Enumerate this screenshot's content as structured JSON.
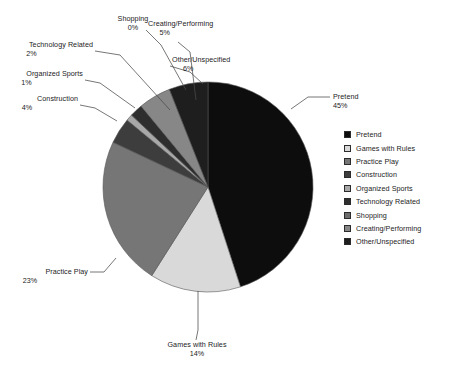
{
  "chart_data": {
    "type": "pie",
    "title": "",
    "subtitle": "",
    "xlabel": "",
    "ylabel": "",
    "legend_position": "right",
    "grid": false,
    "start_angle_deg": 0,
    "direction": "clockwise",
    "categories": [
      "Pretend",
      "Games with Rules",
      "Practice Play",
      "Construction",
      "Organized Sports",
      "Technology Related",
      "Shopping",
      "Creating/Performing",
      "Other/Unspecified"
    ],
    "values": [
      45,
      14,
      23,
      4,
      1,
      2,
      0,
      5,
      6
    ],
    "value_labels": [
      "45%",
      "14%",
      "23%",
      "4%",
      "1%",
      "2%",
      "0%",
      "5%",
      "6%"
    ],
    "units": "percent",
    "colors": [
      "#0d0d0d",
      "#d9d9d9",
      "#767676",
      "#3d3d3d",
      "#a8a8a8",
      "#2e2e2e",
      "#6e6e6e",
      "#878787",
      "#1e1e1e"
    ],
    "slices": [
      {
        "label": "Pretend",
        "value": 45,
        "value_label": "45%",
        "color": "#0d0d0d"
      },
      {
        "label": "Games with Rules",
        "value": 14,
        "value_label": "14%",
        "color": "#d9d9d9"
      },
      {
        "label": "Practice Play",
        "value": 23,
        "value_label": "23%",
        "color": "#767676"
      },
      {
        "label": "Construction",
        "value": 4,
        "value_label": "4%",
        "color": "#3d3d3d"
      },
      {
        "label": "Organized Sports",
        "value": 1,
        "value_label": "1%",
        "color": "#a8a8a8"
      },
      {
        "label": "Technology Related",
        "value": 2,
        "value_label": "2%",
        "color": "#2e2e2e"
      },
      {
        "label": "Shopping",
        "value": 0,
        "value_label": "0%",
        "color": "#6e6e6e"
      },
      {
        "label": "Creating/Performing",
        "value": 5,
        "value_label": "5%",
        "color": "#878787"
      },
      {
        "label": "Other/Unspecified",
        "value": 6,
        "value_label": "6%",
        "color": "#1e1e1e"
      }
    ]
  },
  "callouts": {
    "shopping": {
      "name": "Shopping",
      "pct": "0%"
    },
    "creating_performing": {
      "name": "Creating/Performing",
      "pct": "5%"
    },
    "technology_related": {
      "name": "Technology Related",
      "pct": "2%"
    },
    "other_unspecified": {
      "name": "Other/Unspecified",
      "pct": "6%"
    },
    "organized_sports": {
      "name": "Organized Sports",
      "pct": "1%"
    },
    "construction": {
      "name": "Construction",
      "pct": "4%"
    },
    "pretend": {
      "name": "Pretend",
      "pct": "45%"
    },
    "practice_play": {
      "name": "Practice Play",
      "pct": "23%"
    },
    "games_with_rules": {
      "name": "Games with Rules",
      "pct": "14%"
    }
  },
  "legend": {
    "items": [
      {
        "label": "Pretend",
        "color": "#0d0d0d"
      },
      {
        "label": "Games with Rules",
        "color": "#d9d9d9"
      },
      {
        "label": "Practice Play",
        "color": "#767676"
      },
      {
        "label": "Construction",
        "color": "#3d3d3d"
      },
      {
        "label": "Organized Sports",
        "color": "#a8a8a8"
      },
      {
        "label": "Technology Related",
        "color": "#2e2e2e"
      },
      {
        "label": "Shopping",
        "color": "#6e6e6e"
      },
      {
        "label": "Creating/Performing",
        "color": "#878787"
      },
      {
        "label": "Other/Unspecified",
        "color": "#1e1e1e"
      }
    ]
  }
}
